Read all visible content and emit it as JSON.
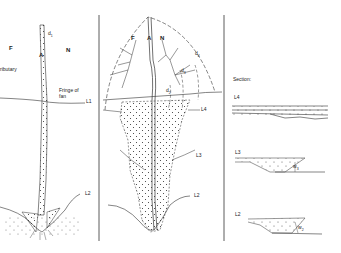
{
  "figure": {
    "type": "diagram",
    "stroke_color": "#333333",
    "background": "#ffffff"
  },
  "panel_left": {
    "labels": {
      "F": "F",
      "N": "N",
      "A": "A",
      "d1": "d",
      "d1_sub": "1",
      "tributary": "ributary",
      "fringe": "Fringe of",
      "fringe2": "fan",
      "L1": "L1",
      "L2": "L2"
    }
  },
  "panel_middle": {
    "labels": {
      "F": "F",
      "A": "A",
      "N": "N",
      "d4": "d",
      "d4_sub": "4",
      "d3": "d",
      "d3_sub": "3",
      "d2": "d",
      "d2_sub": "2",
      "L4": "L4",
      "L3": "L3",
      "L2": "L2"
    }
  },
  "panel_right": {
    "title": "Section:",
    "sections": [
      {
        "label": "L4",
        "annotation": ""
      },
      {
        "label": "L3",
        "annotation": "w",
        "annotation_sub": "3"
      },
      {
        "label": "L2",
        "annotation": "w",
        "annotation_sub": "2"
      }
    ]
  }
}
